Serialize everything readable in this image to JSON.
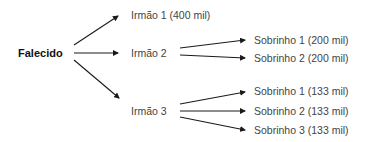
{
  "diagram": {
    "root": {
      "label": "Falecido"
    },
    "siblings": [
      {
        "label": "Irmão 1 (400 mil)",
        "share": "400 mil",
        "children": []
      },
      {
        "label": "Irmão 2",
        "children": [
          {
            "label": "Sobrinho 1 (200 mil)"
          },
          {
            "label": "Sobrinho 2 (200 mil)"
          }
        ]
      },
      {
        "label": "Irmão 3",
        "children": [
          {
            "label": "Sobrinho 1 (133 mil)"
          },
          {
            "label": "Sobrinho 2 (133 mil)"
          },
          {
            "label": "Sobrinho 3 (133 mil)"
          }
        ]
      }
    ],
    "colors": {
      "arrow": "#1a1a1a",
      "text": "#444444",
      "root_text": "#111111"
    }
  }
}
